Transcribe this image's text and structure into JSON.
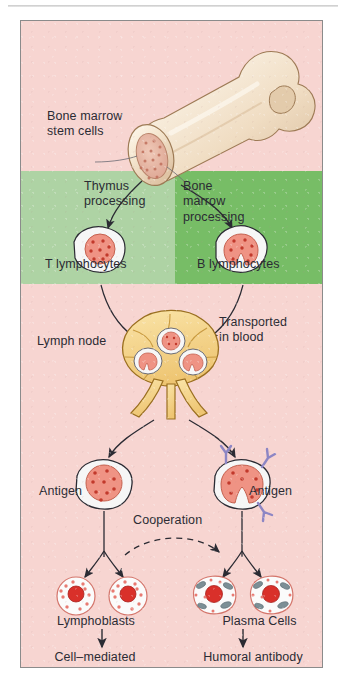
{
  "figure": {
    "background_color": "#f7d5d1",
    "border_color": "#8b8b8b"
  },
  "bands": {
    "top": {
      "name": "bone-marrow-region",
      "color": "#f7d5d1"
    },
    "thymus": {
      "name": "thymus-processing-region",
      "color": "#aed3a4"
    },
    "bone_marrow_processing": {
      "name": "bone-marrow-processing-region",
      "color": "#77bd66"
    },
    "bottom": {
      "name": "lymph-node-region",
      "color": "#f7d5d1"
    }
  },
  "labels": {
    "bone_marrow_stem_cells": "Bone marrow\nstem cells",
    "thymus_processing": "Thymus\nprocessing",
    "bone_marrow_processing": "Bone\nmarrow\nprocessing",
    "t_lymphocytes": "T lymphocytes",
    "b_lymphocytes": "B lymphocytes",
    "lymph_node": "Lymph node",
    "transported_in_blood": "Transported\nin blood",
    "antigen_left": "Antigen",
    "antigen_right": "Antigen",
    "cooperation": "Cooperation",
    "lymphoblasts": "Lymphoblasts",
    "plasma_cells": "Plasma Cells",
    "cell_mediated_reactions": "Cell–mediated\nreactions",
    "humoral_antibody_synthesis": "Humoral antibody\nsynthesis"
  },
  "structures": {
    "bone": {
      "name": "femur-bone",
      "fill": "#f6e7d2",
      "marrow_fill": "#e8b9a8"
    },
    "lymph_node": {
      "name": "lymph-node",
      "fill": "#f5d68f",
      "stroke": "#b98a33"
    },
    "t_cell": {
      "name": "t-lymphocyte-cell",
      "cytoplasm": "#f4f4f4",
      "nucleus": "#ef9384"
    },
    "b_cell": {
      "name": "b-lymphocyte-cell",
      "cytoplasm": "#f4f4f4",
      "nucleus": "#ef9384"
    },
    "antibody": {
      "name": "antibody-y-marker",
      "color": "#8d86c4"
    },
    "lymphoblast": {
      "name": "lymphoblast-cell",
      "nucleus": "#d9302a",
      "granule": "#e87a72"
    },
    "plasma_cell": {
      "name": "plasma-cell",
      "nucleus": "#d9302a",
      "organelle": "#7c8f96"
    }
  },
  "arrows": {
    "stem_to_thymus": "curved arrow from bone marrow to T lymphocyte",
    "stem_to_bone_marrow": "curved arrow from bone marrow to B lymphocyte",
    "t_to_node": "curved arrow from T lymphocyte to lymph node",
    "b_to_node": "curved arrow from B lymphocyte to lymph node",
    "node_to_tcell": "curved arrow from lymph node to activated T cell",
    "node_to_bcell": "curved arrow from lymph node to activated B cell",
    "cooperation": "dashed curved arrow from lymphoblasts to plasma cells",
    "tcell_to_blasts": "branching arrows to lymphoblasts",
    "bcell_to_plasma": "branching arrows to plasma cells",
    "blasts_to_reactions": "straight arrow down to cell-mediated reactions",
    "plasma_to_humoral": "straight arrow down to humoral antibody synthesis"
  }
}
